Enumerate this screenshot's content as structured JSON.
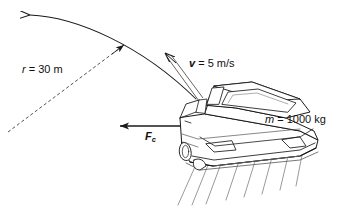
{
  "figure": {
    "background_color": "#ffffff",
    "line_color": "#1a1a1a",
    "labels": {
      "radius": {
        "symbol": "r",
        "equals": " = ",
        "value": "30 m",
        "full": "r = 30 m"
      },
      "velocity": {
        "symbol": "v",
        "equals": " = ",
        "value": "5 m/s",
        "full": "v = 5 m/s"
      },
      "mass": {
        "symbol": "m",
        "equals": " = ",
        "value": "1000 kg",
        "full": "m = 1000 kg"
      },
      "force": {
        "symbol": "F",
        "subscript": "c",
        "full": "Fc"
      }
    },
    "elements": {
      "arc_path": "curved-road-arc",
      "radius_line": "dashed-radius-line",
      "velocity_arrow": "tangential-velocity-arrow",
      "force_arrow": "centripetal-force-arrow",
      "vehicle": "sedan-car",
      "motion_lines": "speed-motion-lines"
    }
  }
}
